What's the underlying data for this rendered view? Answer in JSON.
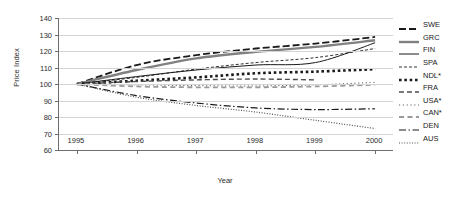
{
  "chart_data": {
    "type": "line",
    "title": "",
    "xlabel": "Year",
    "ylabel": "Price Index",
    "xlim": [
      1994.7,
      2000.3
    ],
    "ylim": [
      60,
      140
    ],
    "yticks": [
      60,
      70,
      80,
      90,
      100,
      110,
      120,
      130,
      140
    ],
    "categories": [
      "1995",
      "1996",
      "1997",
      "1998",
      "1999",
      "2000"
    ],
    "x": [
      1995,
      1996,
      1997,
      1998,
      1999,
      2000
    ],
    "grid": true,
    "legend_position": "right",
    "series": [
      {
        "name": "SWE",
        "style": "long-dash",
        "color": "#1a1a1a",
        "width": 1.8,
        "values": [
          100,
          111.5,
          117.5,
          121.5,
          124.5,
          128.5
        ]
      },
      {
        "name": "GRC",
        "style": "solid",
        "color": "#808080",
        "width": 2.4,
        "values": [
          100,
          108.5,
          115.5,
          119.5,
          122.5,
          126.5
        ]
      },
      {
        "name": "FIN",
        "style": "solid",
        "color": "#1a1a1a",
        "width": 1.0,
        "values": [
          100,
          104.5,
          108.5,
          111.5,
          113.0,
          125.0
        ]
      },
      {
        "name": "SPA",
        "style": "short-dash",
        "color": "#1a1a1a",
        "width": 0.9,
        "values": [
          100,
          104.0,
          109.0,
          113.0,
          116.0,
          121.5
        ]
      },
      {
        "name": "NDL*",
        "style": "square-dot",
        "color": "#1a1a1a",
        "width": 2.6,
        "values": [
          100,
          102.0,
          104.0,
          106.5,
          107.5,
          109.0
        ]
      },
      {
        "name": "FRA",
        "style": "dash",
        "color": "#4d4d4d",
        "width": 1.4,
        "values": [
          100,
          101.5,
          102.5,
          103.0,
          102.5,
          null
        ]
      },
      {
        "name": "USA*",
        "style": "fine-dot",
        "color": "#4d4d4d",
        "width": 0.9,
        "values": [
          100,
          99.5,
          99.0,
          98.8,
          99.5,
          101.0
        ]
      },
      {
        "name": "CAN*",
        "style": "dash-gray",
        "color": "#9a9a9a",
        "width": 1.8,
        "values": [
          100,
          98.5,
          98.0,
          98.0,
          98.5,
          99.5
        ]
      },
      {
        "name": "DEN",
        "style": "dash-dot",
        "color": "#1a1a1a",
        "width": 1.2,
        "values": [
          100,
          93.0,
          88.5,
          85.5,
          84.5,
          85.0
        ]
      },
      {
        "name": "AUS",
        "style": "dotted",
        "color": "#4d4d4d",
        "width": 1.2,
        "values": [
          100,
          92.0,
          87.0,
          83.0,
          78.0,
          73.0
        ]
      }
    ]
  },
  "legend": {
    "items": [
      {
        "label": "SWE"
      },
      {
        "label": "GRC"
      },
      {
        "label": "FIN"
      },
      {
        "label": "SPA"
      },
      {
        "label": "NDL*"
      },
      {
        "label": "FRA"
      },
      {
        "label": "USA*"
      },
      {
        "label": "CAN*"
      },
      {
        "label": "DEN"
      },
      {
        "label": "AUS"
      }
    ]
  },
  "colors": {
    "axis": "#6e6e6e",
    "grid": "#d4d4d4",
    "text": "#2b2b2b",
    "background": "#ffffff"
  }
}
